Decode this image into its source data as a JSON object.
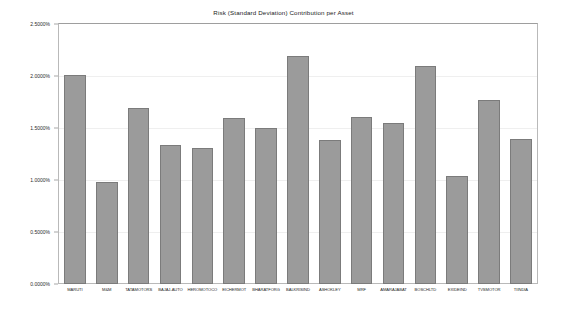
{
  "chart_data": {
    "type": "bar",
    "title": "Risk (Standard Deviation) Contribution per Asset",
    "xlabel": "",
    "ylabel": "",
    "ylim": [
      0,
      2.5
    ],
    "ytick_labels": [
      "0.0000%",
      "0.5000%",
      "1.0000%",
      "1.5000%",
      "2.0000%",
      "2.5000%"
    ],
    "ytick_values": [
      0,
      0.5,
      1.0,
      1.5,
      2.0,
      2.5
    ],
    "grid": true,
    "legend": "none",
    "bar_color": "#9b9b9b",
    "bar_edge_color": "#7b7b7b",
    "categories": [
      "MARUTI",
      "M&M",
      "TATAMOTORS",
      "BAJAJ-AUTO",
      "HEROMOTOCO",
      "EICHERMOT",
      "BHARATFORG",
      "BALKRISIND",
      "ASHOKLEY",
      "MRF",
      "AMARAJABAT",
      "BOSCHLTD",
      "EXIDEIND",
      "TVSMOTOR",
      "TIINDIA"
    ],
    "values": [
      2.01,
      0.98,
      1.69,
      1.34,
      1.31,
      1.6,
      1.5,
      2.19,
      1.38,
      1.61,
      1.55,
      2.1,
      1.04,
      1.77,
      1.39
    ]
  }
}
